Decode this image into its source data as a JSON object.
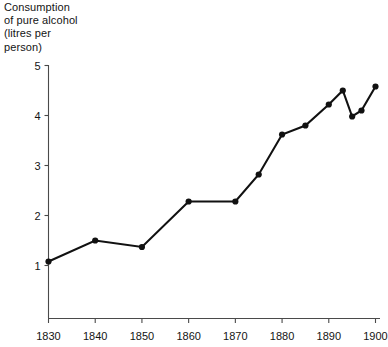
{
  "chart_data": {
    "type": "line",
    "title": "Consumption\nof pure alcohol\n(litres per\nperson)",
    "title_lines": [
      "Consumption",
      "of pure alcohol",
      "(litres per",
      "person)"
    ],
    "xlabel": "",
    "ylabel": "Consumption of pure alcohol (litres per person)",
    "xlim": [
      1830,
      1900
    ],
    "ylim": [
      0.45,
      5
    ],
    "xticks": [
      1830,
      1840,
      1850,
      1860,
      1870,
      1880,
      1890,
      1900
    ],
    "xtick_labels": [
      "1830",
      "1840",
      "1850",
      "1860",
      "1870",
      "1880",
      "1890",
      "1900"
    ],
    "yticks": [
      1,
      2,
      3,
      4,
      5
    ],
    "ytick_labels": [
      "1",
      "2",
      "3",
      "4",
      "5"
    ],
    "grid": false,
    "legend": false,
    "marker": "filled-circle",
    "line_color": "#111111",
    "x": [
      1830,
      1840,
      1850,
      1860,
      1870,
      1875,
      1880,
      1885,
      1890,
      1893,
      1895,
      1897,
      1900
    ],
    "values": [
      1.08,
      1.5,
      1.37,
      2.28,
      2.28,
      2.82,
      3.62,
      3.8,
      4.22,
      4.5,
      3.98,
      4.1,
      4.58
    ],
    "points": [
      {
        "x": 1830,
        "y": 1.08
      },
      {
        "x": 1840,
        "y": 1.5
      },
      {
        "x": 1850,
        "y": 1.37
      },
      {
        "x": 1860,
        "y": 2.28
      },
      {
        "x": 1870,
        "y": 2.28
      },
      {
        "x": 1875,
        "y": 2.82
      },
      {
        "x": 1880,
        "y": 3.62
      },
      {
        "x": 1885,
        "y": 3.8
      },
      {
        "x": 1890,
        "y": 4.22
      },
      {
        "x": 1893,
        "y": 4.5
      },
      {
        "x": 1895,
        "y": 3.98
      },
      {
        "x": 1897,
        "y": 4.1
      },
      {
        "x": 1900,
        "y": 4.58
      }
    ]
  }
}
